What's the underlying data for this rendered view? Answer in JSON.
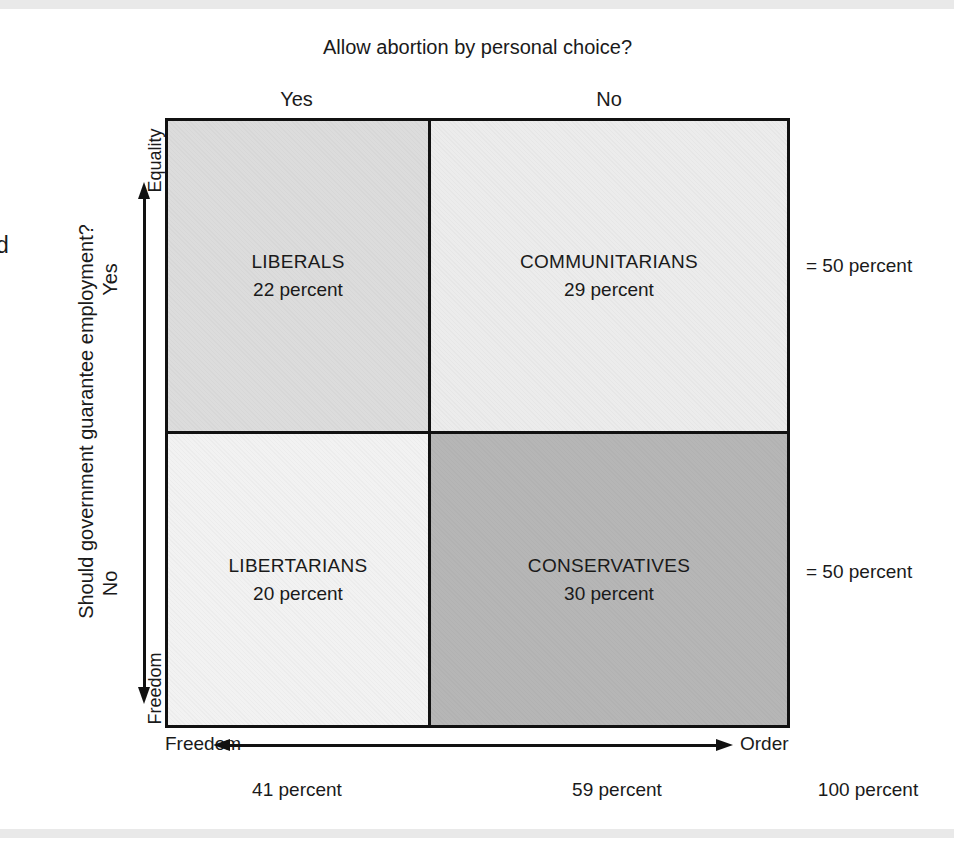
{
  "chart_data": {
    "type": "table",
    "title": "Allow abortion by personal choice?",
    "xlabel": "Freedom ↔ Order",
    "ylabel": "Should government guarantee employment?",
    "grid": false,
    "legend": "none",
    "categories": [
      "Yes",
      "No"
    ],
    "row_categories": [
      "Yes",
      "No"
    ],
    "cells": [
      {
        "row": "Yes",
        "column": "Yes",
        "name": "LIBERALS",
        "value": 22,
        "value_label": "22 percent",
        "fill": "#dcdcdc"
      },
      {
        "row": "Yes",
        "column": "No",
        "name": "COMMUNITARIANS",
        "value": 29,
        "value_label": "29 percent",
        "fill": "#ececec"
      },
      {
        "row": "No",
        "column": "Yes",
        "name": "LIBERTARIANS",
        "value": 20,
        "value_label": "20 percent",
        "fill": "#f2f2f2"
      },
      {
        "row": "No",
        "column": "No",
        "name": "CONSERVATIVES",
        "value": 30,
        "value_label": "30 percent",
        "fill": "#b6b6b6"
      }
    ],
    "row_totals": [
      50,
      50
    ],
    "column_totals": [
      41,
      59
    ],
    "grand_total": 100
  },
  "colors": {
    "ink": "#1a1a1a",
    "rule": "#111111",
    "page": "#ffffff",
    "scan_band": "#e9e9e9",
    "fill_liberals": "#dcdcdc",
    "fill_communitarians": "#ececec",
    "fill_libertarians": "#f2f2f2",
    "fill_conservatives": "#b6b6b6"
  },
  "page": {
    "edge_glyph": "d"
  },
  "top": {
    "question": "Allow abortion by personal choice?",
    "col_yes": "Yes",
    "col_no": "No"
  },
  "left": {
    "question": "Should government guarantee employment?",
    "row_yes": "Yes",
    "row_no": "No",
    "axis_top": "Equality",
    "axis_bottom": "Freedom"
  },
  "matrix": {
    "top_left": {
      "name": "LIBERALS",
      "percent": "22 percent"
    },
    "top_right": {
      "name": "COMMUNITARIANS",
      "percent": "29 percent"
    },
    "bottom_left": {
      "name": "LIBERTARIANS",
      "percent": "20 percent"
    },
    "bottom_right": {
      "name": "CONSERVATIVES",
      "percent": "30 percent"
    }
  },
  "right": {
    "row1_total": "= 50 percent",
    "row2_total": "= 50 percent"
  },
  "bottom": {
    "axis_left": "Freedom",
    "axis_right": "Order",
    "col1_total": "41 percent",
    "col2_total": "59 percent",
    "grand_total": "100 percent"
  }
}
